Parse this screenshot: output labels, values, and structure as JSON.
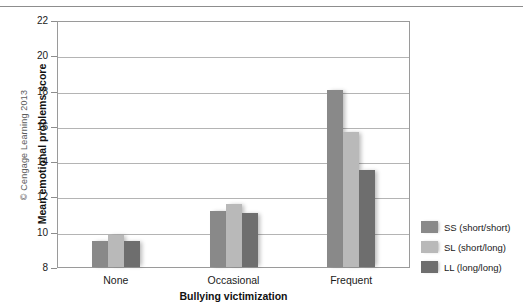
{
  "figure": {
    "copyright": "© Cengage Learning 2013"
  },
  "chart_data": {
    "type": "bar",
    "title": "",
    "xlabel": "Bullying victimization",
    "ylabel": "Mean emotional problems score",
    "categories": [
      "None",
      "Occasional",
      "Frequent"
    ],
    "series": [
      {
        "name": "SS (short/short)",
        "color": "#898989",
        "values": [
          9.5,
          11.2,
          18.05
        ]
      },
      {
        "name": "SL (short/long)",
        "color": "#b9b9b9",
        "values": [
          9.8,
          11.6,
          15.65
        ]
      },
      {
        "name": "LL (long/long)",
        "color": "#6e6e6e",
        "values": [
          9.5,
          11.05,
          13.5
        ]
      }
    ],
    "ylim": [
      8,
      22
    ],
    "yticks": [
      8,
      10,
      12,
      14,
      16,
      18,
      20,
      22
    ],
    "ytick_labels": [
      "8",
      "10",
      "12",
      "14",
      "16",
      "18",
      "20",
      "22"
    ],
    "grid": true,
    "legend_position": "right"
  }
}
